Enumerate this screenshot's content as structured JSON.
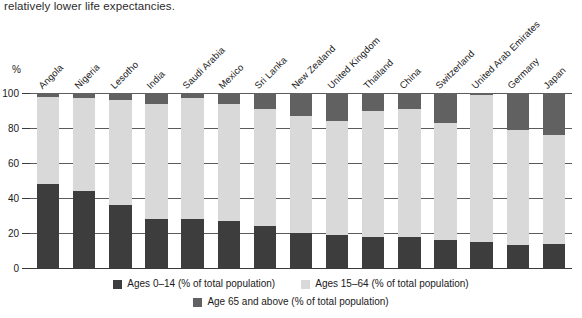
{
  "body_text": {
    "line": "relatively lower life expectancies."
  },
  "chart_data": {
    "type": "bar",
    "subtype": "stacked-bar-100",
    "title": "",
    "xlabel": "",
    "ylabel": "%",
    "ylim": [
      0,
      100
    ],
    "yticks": [
      0,
      20,
      40,
      60,
      80,
      100
    ],
    "grid": true,
    "legend_position": "bottom",
    "categories": [
      "Angola",
      "Nigeria",
      "Lesotho",
      "India",
      "Saudi Arabia",
      "Mexico",
      "Sri Lanka",
      "New Zealand",
      "United Kingdom",
      "Thailand",
      "China",
      "Switzerland",
      "United Arab Emirates",
      "Germany",
      "Japan"
    ],
    "series": [
      {
        "name": "Ages 0–14 (% of total population)",
        "color": "#3d3d3d",
        "values": [
          48,
          44,
          36,
          28,
          28,
          27,
          24,
          20,
          19,
          18,
          18,
          16,
          15,
          13,
          14
        ]
      },
      {
        "name": "Ages 15–64 (% of total population)",
        "color": "#d9d9d9",
        "values": [
          50,
          53,
          60,
          66,
          69,
          67,
          67,
          67,
          65,
          72,
          73,
          67,
          84,
          66,
          62
        ]
      },
      {
        "name": "Age 65 and above (% of total population)",
        "color": "#616161",
        "values": [
          2,
          3,
          4,
          6,
          3,
          6,
          9,
          13,
          16,
          10,
          9,
          17,
          1,
          21,
          24
        ]
      }
    ]
  },
  "legend": {
    "items": [
      {
        "label": "Ages 0–14 (% of total population)",
        "color": "#3d3d3d"
      },
      {
        "label": "Ages 15–64 (% of total population)",
        "color": "#d9d9d9"
      },
      {
        "label": "Age 65 and above (% of total population)",
        "color": "#616161"
      }
    ]
  }
}
